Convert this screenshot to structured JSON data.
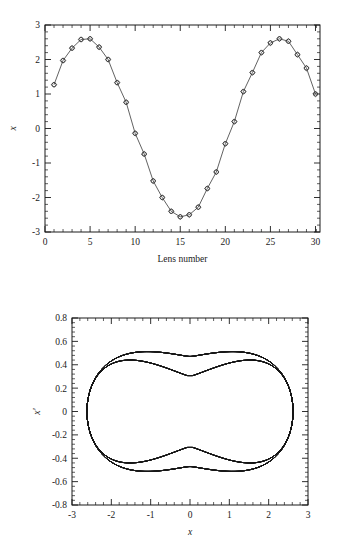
{
  "figure": {
    "name": "beam-transport-figure",
    "panels": [
      "lens-number-trajectory",
      "phase-space-portrait"
    ]
  },
  "chart_data": [
    {
      "id": "top",
      "type": "line",
      "title": "",
      "xlabel": "Lens number",
      "ylabel": "x",
      "xlim": [
        0,
        30.5
      ],
      "ylim": [
        -3,
        3
      ],
      "xticks": [
        0,
        5,
        10,
        15,
        20,
        25,
        30
      ],
      "xticklabels": [
        "0",
        "5",
        "10",
        "15",
        "20",
        "25",
        "30"
      ],
      "yticks": [
        -3,
        -2,
        -1,
        0,
        1,
        2,
        3
      ],
      "yticklabels": [
        "-3",
        "-2",
        "-1",
        "0",
        "1",
        "2",
        "3"
      ],
      "minor_x_per_major": 5,
      "minor_y_per_major": 5,
      "grid": false,
      "legend": false,
      "marker": "diamond-circle",
      "x": [
        1,
        2,
        3,
        4,
        5,
        6,
        7,
        8,
        9,
        10,
        11,
        12,
        13,
        14,
        15,
        16,
        17,
        18,
        19,
        20,
        21,
        22,
        23,
        24,
        25,
        26,
        27,
        28,
        29,
        30
      ],
      "values": [
        1.27,
        1.97,
        2.33,
        2.58,
        2.6,
        2.36,
        2.0,
        1.33,
        0.76,
        -0.14,
        -0.74,
        -1.52,
        -2.0,
        -2.4,
        -2.56,
        -2.5,
        -2.28,
        -1.74,
        -1.26,
        -0.44,
        0.2,
        1.07,
        1.62,
        2.2,
        2.48,
        2.6,
        2.53,
        2.14,
        1.75,
        1.0
      ]
    },
    {
      "id": "bottom",
      "type": "scatter",
      "title": "",
      "xlabel": "x",
      "ylabel": "x′",
      "xlim": [
        -3,
        3
      ],
      "ylim": [
        -0.8,
        0.8
      ],
      "xticks": [
        -3,
        -2,
        -1,
        0,
        1,
        2,
        3
      ],
      "xticklabels": [
        "-3",
        "-2",
        "-1",
        "0",
        "1",
        "2",
        "3"
      ],
      "yticks": [
        -0.8,
        -0.6,
        -0.4,
        -0.2,
        0,
        0.2,
        0.4,
        0.6,
        0.8
      ],
      "yticklabels": [
        "-0.8",
        "-0.6",
        "-0.4",
        "-0.2",
        "0",
        "0.2",
        "0.4",
        "0.6",
        "0.8"
      ],
      "minor_x_per_major": 5,
      "minor_y_per_major": 5,
      "grid": false,
      "legend": false,
      "description": "phase-space bow-tie envelope",
      "envelope": {
        "x_max": 2.62,
        "xprime_max": 0.75,
        "waist_x": 0.0,
        "waist_xprime_outer": 0.47,
        "waist_xprime_inner": 0.3,
        "inner_hole_x_half": 1.28,
        "inner_hole_xprime_half": 0.3
      },
      "n_trajectories": 48,
      "color": "#1a1a1a"
    }
  ]
}
